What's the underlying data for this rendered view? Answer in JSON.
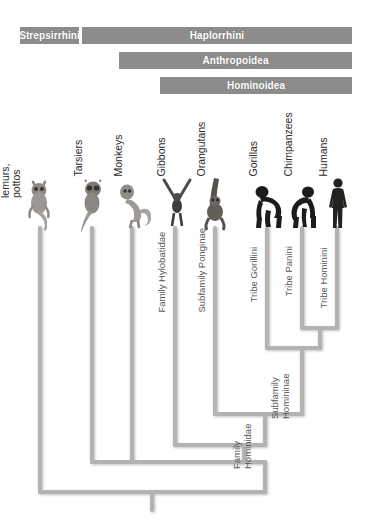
{
  "figure": {
    "line_color": "#b3b3b3",
    "bar_color": "#8c8c8c",
    "bar_text_color": "#ffffff",
    "label_color": "#2b2b2b",
    "node_label_color": "#585858",
    "background": "#ffffff"
  },
  "clade_bars": [
    {
      "id": "strepsirrhini",
      "label": "Strepsirrhini",
      "x": 20,
      "y": 27,
      "width": 59,
      "height": 17
    },
    {
      "id": "haplorrhini",
      "label": "Haplorrhini",
      "x": 82,
      "y": 27,
      "width": 270,
      "height": 17
    },
    {
      "id": "anthropoidea",
      "label": "Anthropoidea",
      "x": 119,
      "y": 52,
      "width": 233,
      "height": 17
    },
    {
      "id": "hominoidea",
      "label": "Hominoidea",
      "x": 160,
      "y": 77,
      "width": 192,
      "height": 17
    }
  ],
  "tips": [
    {
      "id": "bush-babies",
      "label": "Bush babies,\nlemurs,\npottos",
      "lines": [
        "Bush babies,",
        "lemurs,",
        "pottos"
      ],
      "x": 40,
      "animal": "galago"
    },
    {
      "id": "tarsiers",
      "label": "Tarsiers",
      "lines": [
        "Tarsiers"
      ],
      "x": 92,
      "animal": "tarsier"
    },
    {
      "id": "monkeys",
      "label": "Monkeys",
      "lines": [
        "Monkeys"
      ],
      "x": 132,
      "animal": "monkey"
    },
    {
      "id": "gibbons",
      "label": "Gibbons",
      "lines": [
        "Gibbons"
      ],
      "x": 175,
      "animal": "gibbon"
    },
    {
      "id": "orangutans",
      "label": "Orangutans",
      "lines": [
        "Orangutans"
      ],
      "x": 215,
      "animal": "orangutan"
    },
    {
      "id": "gorillas",
      "label": "Gorillas",
      "lines": [
        "Gorillas"
      ],
      "x": 267,
      "animal": "gorilla"
    },
    {
      "id": "chimpanzees",
      "label": "Chimpanzees",
      "lines": [
        "Chimpanzees"
      ],
      "x": 302,
      "animal": "chimpanzee"
    },
    {
      "id": "humans",
      "label": "Humans",
      "lines": [
        "Humans"
      ],
      "x": 337,
      "animal": "human"
    }
  ],
  "node_labels": [
    {
      "id": "family-hylobatidae",
      "lines": [
        "Family Hylobatidae"
      ],
      "x": 167,
      "y": 300
    },
    {
      "id": "subfamily-ponginae",
      "lines": [
        "Subfamily Ponginae"
      ],
      "x": 207,
      "y": 300
    },
    {
      "id": "tribe-gorillini",
      "lines": [
        "Tribe Gorillini"
      ],
      "x": 259,
      "y": 296
    },
    {
      "id": "tribe-panini",
      "lines": [
        "Tribe Panini"
      ],
      "x": 294,
      "y": 292
    },
    {
      "id": "tribe-hominini",
      "lines": [
        "Tribe Hominini"
      ],
      "x": 329,
      "y": 300
    },
    {
      "id": "subfamily-homininae",
      "lines": [
        "Subfamily",
        "Homininae"
      ],
      "x": 294,
      "y": 400
    },
    {
      "id": "family-hominidae",
      "lines": [
        "Family",
        "Hominidae"
      ],
      "x": 256,
      "y": 450
    }
  ],
  "tree_structure": {
    "root_stem_x": 152,
    "root_y": 510,
    "nodes": [
      {
        "id": "primates",
        "y": 492,
        "children_x": [
          40,
          265
        ],
        "label": null
      },
      {
        "id": "haplorrhini",
        "y": 462,
        "children_x": [
          92,
          244
        ],
        "label": "Haplorrhini"
      },
      {
        "id": "anthropoidea",
        "y": 462,
        "children_x": [
          132,
          244
        ],
        "label": "Anthropoidea"
      },
      {
        "id": "hominoidea",
        "y": 445,
        "children_x": [
          175,
          265
        ],
        "label": "Hominoidea"
      },
      {
        "id": "hominidae",
        "y": 414,
        "children_x": [
          215,
          302
        ],
        "label": "Family Hominidae"
      },
      {
        "id": "homininae",
        "y": 348,
        "children_x": [
          267,
          320
        ],
        "label": "Subfamily Homininae"
      },
      {
        "id": "pan-homo",
        "y": 328,
        "children_x": [
          302,
          337
        ],
        "label": null
      }
    ]
  }
}
